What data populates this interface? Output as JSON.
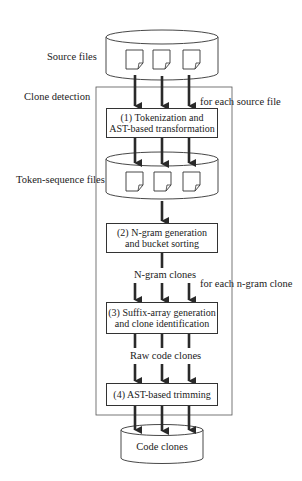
{
  "diagram": {
    "inputs": {
      "source_files_label": "Source files",
      "token_files_label": "Token-sequence files",
      "output_label": "Code clones"
    },
    "container": {
      "label": "Clone detection"
    },
    "loop_labels": {
      "per_source_file": "for each source file",
      "per_ngram_clone": "for each n-gram clone"
    },
    "steps": [
      {
        "id": 1,
        "line1": "(1) Tokenization and",
        "line2": "AST-based transformation"
      },
      {
        "id": 2,
        "line1": "(2) N-gram generation",
        "line2": "and bucket sorting"
      },
      {
        "id": 3,
        "line1": "(3) Suffix-array generation",
        "line2": "and clone identification"
      },
      {
        "id": 4,
        "line1": "(4) AST-based trimming",
        "line2": ""
      }
    ],
    "edge_labels": {
      "ngram_clones": "N-gram clones",
      "raw_code_clones": "Raw code clones"
    },
    "colors": {
      "stroke": "#333333",
      "arrow": "#2a2a2a",
      "background": "#ffffff"
    }
  }
}
